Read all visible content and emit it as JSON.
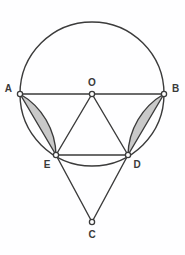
{
  "figure": {
    "name": "circle-geometry-diagram",
    "background_color": "#fefeff",
    "stroke_color": "#3b3b3b",
    "shade_color": "#c9c9c9",
    "point_fill": "#ffffff",
    "stroke_width": 1.4
  },
  "circle": {
    "center_label": "O",
    "center_x": 92,
    "center_y": 94,
    "radius": 72
  },
  "points": [
    {
      "label": "A",
      "x": 20,
      "y": 94,
      "label_x": 12,
      "label_y": 92,
      "anchor": "end"
    },
    {
      "label": "O",
      "x": 92,
      "y": 94,
      "label_x": 92,
      "label_y": 86,
      "anchor": "middle"
    },
    {
      "label": "B",
      "x": 164,
      "y": 94,
      "label_x": 172,
      "label_y": 92,
      "anchor": "start"
    },
    {
      "label": "E",
      "x": 56,
      "y": 155,
      "label_x": 47,
      "label_y": 168,
      "anchor": "middle"
    },
    {
      "label": "D",
      "x": 128,
      "y": 155,
      "label_x": 137,
      "label_y": 168,
      "anchor": "middle"
    },
    {
      "label": "C",
      "x": 92,
      "y": 222,
      "label_x": 92,
      "label_y": 238,
      "anchor": "middle"
    }
  ],
  "segments": [
    {
      "name": "diameter-AB",
      "from": "A",
      "to": "B",
      "x1": 20,
      "y1": 94,
      "x2": 164,
      "y2": 94
    },
    {
      "name": "radius-OE",
      "from": "O",
      "to": "E",
      "x1": 92,
      "y1": 94,
      "x2": 56,
      "y2": 155
    },
    {
      "name": "radius-OD",
      "from": "O",
      "to": "D",
      "x1": 92,
      "y1": 94,
      "x2": 128,
      "y2": 155
    },
    {
      "name": "chord-ED",
      "from": "E",
      "to": "D",
      "x1": 56,
      "y1": 155,
      "x2": 128,
      "y2": 155
    },
    {
      "name": "line-EC",
      "from": "E",
      "to": "C",
      "x1": 56,
      "y1": 155,
      "x2": 92,
      "y2": 222
    },
    {
      "name": "line-DC",
      "from": "D",
      "to": "C",
      "x1": 128,
      "y1": 155,
      "x2": 92,
      "y2": 222
    }
  ],
  "shaded_regions": [
    {
      "name": "left-circular-segment-AE",
      "description": "region between chord AE and minor arc AE",
      "path": "M 20 94 L 56 155 A 72 72 0 0 0 20 94 Z"
    },
    {
      "name": "right-circular-segment-BD",
      "description": "region between chord BD and minor arc BD",
      "path": "M 164 94 L 128 155 A 72 72 0 0 1 164 94 Z"
    }
  ],
  "circle_path": "M 20 94 A 72 72 0 1 1 164 94 A 72 72 0 1 1 20 94",
  "point_marker": {
    "radius": 2.6,
    "stroke_width": 1.3
  }
}
